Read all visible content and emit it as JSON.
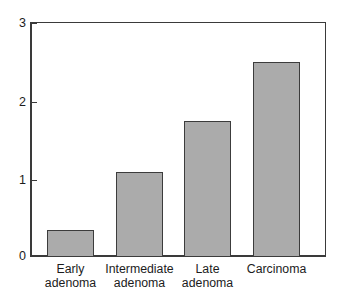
{
  "chart_data": {
    "type": "bar",
    "title": "",
    "subtitle": "",
    "xlabel": "",
    "ylabel": "",
    "categories": [
      "Early adenoma",
      "Intermediate adenoma",
      "Late adenoma",
      "Carcinoma"
    ],
    "category_lines": [
      [
        "Early",
        "adenoma"
      ],
      [
        "Intermediate",
        "adenoma"
      ],
      [
        "Late",
        "adenoma"
      ],
      [
        "Carcinoma",
        ""
      ]
    ],
    "values": [
      0.35,
      1.08,
      1.74,
      2.49
    ],
    "ylim": [
      0,
      3
    ],
    "yticks": [
      0,
      1,
      2,
      3
    ],
    "ytick_labels": [
      "0",
      "1",
      "2",
      "3"
    ],
    "grid": false,
    "legend": false,
    "legend_position": "none",
    "bar_fill_color": "#ababab",
    "bar_edge_color": "#3c3c3c",
    "axis_color": "#3a3a3a",
    "background_color": "#ffffff"
  },
  "axis": {
    "y": {
      "tick_labels": [
        "3",
        "2",
        "1",
        "0"
      ]
    }
  },
  "bars": [
    {
      "label_line1": "Early",
      "label_line2": "adenoma",
      "value": "0.35"
    },
    {
      "label_line1": "Intermediate",
      "label_line2": "adenoma",
      "value": "1.08"
    },
    {
      "label_line1": "Late",
      "label_line2": "adenoma",
      "value": "1.74"
    },
    {
      "label_line1": "Carcinoma",
      "label_line2": "",
      "value": "2.49"
    }
  ]
}
